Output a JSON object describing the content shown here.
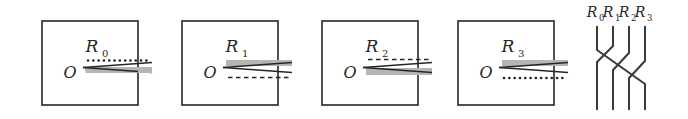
{
  "figure": {
    "type": "mathematical-diagram",
    "panel_count": 4,
    "background_color": "#ffffff",
    "ink_color": "#262626",
    "band_color": "#b3b3b3"
  },
  "panels": [
    {
      "id": "panel-R0",
      "label": "R",
      "subscript": "0",
      "origin_label": "O",
      "box": {
        "x": 42,
        "y": 21,
        "w": 96,
        "h": 84
      },
      "slit": {
        "tip_x": 84,
        "top_y": 62,
        "bottom_y": 73,
        "end_x": 152,
        "top_style": "dotted",
        "bottom_style": "band"
      }
    },
    {
      "id": "panel-R1",
      "label": "R",
      "subscript": "1",
      "origin_label": "O",
      "box": {
        "x": 182,
        "y": 21,
        "w": 96,
        "h": 84
      },
      "slit": {
        "tip_x": 224,
        "top_y": 62,
        "bottom_y": 73,
        "end_x": 292,
        "top_style": "band",
        "bottom_style": "dashed"
      }
    },
    {
      "id": "panel-R2",
      "label": "R",
      "subscript": "2",
      "origin_label": "O",
      "box": {
        "x": 322,
        "y": 21,
        "w": 96,
        "h": 84
      },
      "slit": {
        "tip_x": 364,
        "top_y": 62,
        "bottom_y": 73,
        "end_x": 432,
        "top_style": "dashed",
        "bottom_style": "band"
      }
    },
    {
      "id": "panel-R3",
      "label": "R",
      "subscript": "3",
      "origin_label": "O",
      "box": {
        "x": 458,
        "y": 21,
        "w": 96,
        "h": 84
      },
      "slit": {
        "tip_x": 500,
        "top_y": 62,
        "bottom_y": 73,
        "end_x": 568,
        "top_style": "band",
        "bottom_style": "dotted"
      }
    }
  ],
  "braid": {
    "id": "braid-diagram",
    "strand_labels": [
      {
        "label": "R",
        "subscript": "0",
        "x": 597
      },
      {
        "label": "R",
        "subscript": "1",
        "x": 613
      },
      {
        "label": "R",
        "subscript": "2",
        "x": 629
      },
      {
        "label": "R",
        "subscript": "3",
        "x": 645
      }
    ],
    "label_y": 13,
    "top_y": 26,
    "bottom_y": 110,
    "cross_top_y": 52,
    "cross_bottom_y": 84,
    "strand_count": 4,
    "permutation_note": "cyclic shift"
  }
}
